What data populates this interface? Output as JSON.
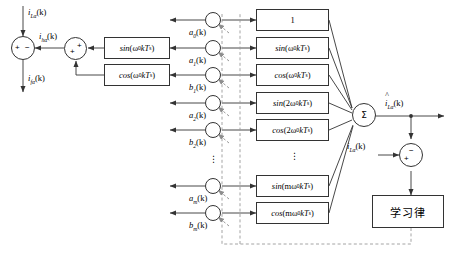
{
  "diagram": {
    "accent": "#333333",
    "dashed_color": "#9a9a9a"
  },
  "signals": {
    "input_load": "i",
    "input_load_sub": "Lα",
    "input_load_arg": "(k)",
    "harmonic": "i",
    "harmonic_sub": "hα",
    "harmonic_arg": "(k)",
    "fundamental_out": "i",
    "fundamental_out_sub": "fα",
    "fundamental_out_arg": "(k)",
    "estimate": "i",
    "estimate_sub": "Lα",
    "estimate_arg": "(k)",
    "estimate_hat": "^",
    "error_in": "i",
    "error_in_sub": "Lα",
    "error_in_arg": "(k)"
  },
  "left_blocks": [
    {
      "name": "sin-block-left",
      "fn": "sin",
      "arg": "(ω",
      "sub": "0",
      "tail": "kT",
      "tail_sub": "s",
      "close": ")"
    },
    {
      "name": "cos-block-left",
      "fn": "cos",
      "arg": "(ω",
      "sub": "0",
      "tail": "kT",
      "tail_sub": "s",
      "close": ")"
    }
  ],
  "basis_blocks": [
    {
      "name": "basis-constant",
      "label": "1",
      "fn": "",
      "pre": "",
      "sub": "",
      "tail": "",
      "tail_sub": "",
      "close": ""
    },
    {
      "name": "basis-sin-w0",
      "label": "",
      "fn": "sin",
      "pre": "(ω",
      "sub": "0",
      "tail": "kT",
      "tail_sub": "s",
      "close": ")"
    },
    {
      "name": "basis-cos-w0",
      "label": "",
      "fn": "cos",
      "pre": "(ω",
      "sub": "0",
      "tail": "kT",
      "tail_sub": "s",
      "close": ")"
    },
    {
      "name": "basis-sin-2w0",
      "label": "",
      "fn": "sin",
      "pre": "(2ω",
      "sub": "0",
      "tail": "kT",
      "tail_sub": "s",
      "close": ")"
    },
    {
      "name": "basis-cos-2w0",
      "label": "",
      "fn": "cos",
      "pre": "(2ω",
      "sub": "0",
      "tail": "kT",
      "tail_sub": "s",
      "close": ")"
    },
    {
      "name": "basis-sin-mw0",
      "label": "",
      "fn": "sin",
      "pre": "(mω",
      "sub": "0",
      "tail": "kT",
      "tail_sub": "s",
      "close": ")"
    },
    {
      "name": "basis-cos-mw0",
      "label": "",
      "fn": "cos",
      "pre": "(mω",
      "sub": "0",
      "tail": "kT",
      "tail_sub": "s",
      "close": ")"
    }
  ],
  "coefficients": [
    {
      "name": "coef-a0",
      "base": "a",
      "sub": "0",
      "arg": "(k)"
    },
    {
      "name": "coef-a1",
      "base": "a",
      "sub": "1",
      "arg": "(k)"
    },
    {
      "name": "coef-b1",
      "base": "b",
      "sub": "1",
      "arg": "(k)"
    },
    {
      "name": "coef-a2",
      "base": "a",
      "sub": "2",
      "arg": "(k)"
    },
    {
      "name": "coef-b2",
      "base": "b",
      "sub": "2",
      "arg": "(k)"
    },
    {
      "name": "coef-am",
      "base": "a",
      "sub": "m",
      "arg": "(k)"
    },
    {
      "name": "coef-bm",
      "base": "b",
      "sub": "m",
      "arg": "(k)"
    }
  ],
  "sum_nodes": {
    "left_sign_plus": "+",
    "left_sign_minus": "−",
    "mid_sign_plus_a": "+",
    "mid_sign_plus_b": "+",
    "sigma": "Σ",
    "err_sign_minus": "−",
    "err_sign_plus": "+"
  },
  "learning_block": {
    "name": "learning-law-block",
    "label": "学习律"
  },
  "ellipsis": {
    "glyph": "⋮"
  }
}
